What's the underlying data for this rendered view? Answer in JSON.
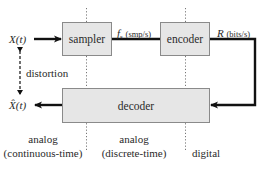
{
  "diagram": {
    "type": "block-diagram",
    "title": "",
    "blocks": {
      "sampler": "sampler",
      "encoder": "encoder",
      "decoder": "decoder"
    },
    "signals": {
      "input_symbol": "X(t)",
      "output_symbol": "X̂(t)",
      "sample_rate_symbol": "f",
      "sample_rate_sub": "s",
      "sample_rate_unit": "(smp/s)",
      "bit_rate_symbol": "R",
      "bit_rate_unit": "(bits/s)"
    },
    "annotations": {
      "distortion": "distortion"
    },
    "regions": [
      {
        "line1": "analog",
        "line2": "(continuous-time)"
      },
      {
        "line1": "analog",
        "line2": "(discrete-time)"
      },
      {
        "line1": "digital"
      }
    ],
    "edges": [
      {
        "from": "X(t)",
        "to": "sampler"
      },
      {
        "from": "sampler",
        "to": "encoder",
        "label": "f_s (smp/s)"
      },
      {
        "from": "encoder",
        "to": "decoder",
        "label": "R (bits/s)"
      },
      {
        "from": "decoder",
        "to": "X̂(t)"
      },
      {
        "from": "X(t)",
        "to": "X̂(t)",
        "label": "distortion",
        "style": "dashed-bidirectional"
      }
    ],
    "colors": {
      "block_fill": "#e6e6e6",
      "block_border": "#8a8a8a",
      "arrow": "#111111",
      "divider": "#777777"
    }
  }
}
